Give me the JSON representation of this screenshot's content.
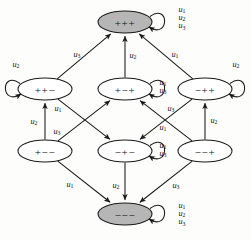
{
  "figure": {
    "node_shape": "ellipse",
    "colors": {
      "stroke": "#1a1a1a",
      "node_fill": "#ffffff",
      "node_fill_shaded": "#b6b6b6",
      "background": "#fdfdfc",
      "text": "#111111"
    }
  },
  "nodes": [
    {
      "id": "ppp",
      "label": "+++",
      "shaded": true,
      "cx": 125,
      "cy": 22,
      "rx": 27,
      "ry": 11
    },
    {
      "id": "ppm",
      "label": "++−",
      "shaded": false,
      "cx": 45,
      "cy": 89,
      "rx": 27,
      "ry": 11
    },
    {
      "id": "pmp",
      "label": "+−+",
      "shaded": false,
      "cx": 125,
      "cy": 89,
      "rx": 27,
      "ry": 11
    },
    {
      "id": "mpp",
      "label": "−++",
      "shaded": false,
      "cx": 205,
      "cy": 89,
      "rx": 27,
      "ry": 11
    },
    {
      "id": "pmm",
      "label": "+−−",
      "shaded": false,
      "cx": 45,
      "cy": 151,
      "rx": 27,
      "ry": 11
    },
    {
      "id": "mpm",
      "label": "−+−",
      "shaded": false,
      "cx": 125,
      "cy": 151,
      "rx": 27,
      "ry": 11
    },
    {
      "id": "mmp",
      "label": "−−+",
      "shaded": false,
      "cx": 205,
      "cy": 151,
      "rx": 27,
      "ry": 11
    },
    {
      "id": "mmm",
      "label": "−−−",
      "shaded": true,
      "cx": 125,
      "cy": 214,
      "rx": 27,
      "ry": 11
    }
  ],
  "self_loops": [
    {
      "id": "loop-ppp",
      "node": "ppp",
      "side": "right",
      "labels": [
        "u1",
        "u2",
        "u3"
      ],
      "label_x": 182,
      "label_y": 9
    },
    {
      "id": "loop-ppm",
      "node": "ppm",
      "side": "left",
      "labels": [
        "u2"
      ],
      "label_x": 16,
      "label_y": 64
    },
    {
      "id": "loop-pmp",
      "node": "pmp",
      "side": "right",
      "labels": [
        "u1",
        "u3"
      ],
      "label_x": 163,
      "label_y": 82
    },
    {
      "id": "loop-mpp",
      "node": "mpp",
      "side": "right",
      "labels": [
        "u2"
      ],
      "label_x": 236,
      "label_y": 64
    },
    {
      "id": "loop-mpm",
      "node": "mpm",
      "side": "right",
      "labels": [
        "u1",
        "u3"
      ],
      "label_x": 163,
      "label_y": 145
    },
    {
      "id": "loop-mmm",
      "node": "mmm",
      "side": "right",
      "labels": [
        "u1",
        "u2",
        "u3"
      ],
      "label_x": 182,
      "label_y": 205
    }
  ],
  "edges": [
    {
      "id": "e-ppm-ppp",
      "from": "ppm",
      "to": "ppp",
      "label": "u3",
      "label_x": 77,
      "label_y": 54
    },
    {
      "id": "e-pmp-ppp",
      "from": "pmp",
      "to": "ppp",
      "label": "u2",
      "label_x": 133,
      "label_y": 55
    },
    {
      "id": "e-mpp-ppp",
      "from": "mpp",
      "to": "ppp",
      "label": "u1",
      "label_x": 175,
      "label_y": 54
    },
    {
      "id": "e-pmm-ppm",
      "from": "pmm",
      "to": "ppm",
      "label": "u2",
      "label_x": 34,
      "label_y": 121
    },
    {
      "id": "e-pmm-pmp",
      "from": "pmm",
      "to": "pmp",
      "label": "u3",
      "label_x": 57,
      "label_y": 131
    },
    {
      "id": "e-ppm-mpm",
      "from": "ppm",
      "to": "mpm",
      "label": "u1",
      "label_x": 58,
      "label_y": 108
    },
    {
      "id": "e-mmp-pmp",
      "from": "mmp",
      "to": "pmp",
      "label": "u3",
      "label_x": 171,
      "label_y": 108
    },
    {
      "id": "e-mpp-mpm",
      "from": "mpp",
      "to": "mpm",
      "label": "u1",
      "label_x": 163,
      "label_y": 127
    },
    {
      "id": "e-mmp-mpp",
      "from": "mmp",
      "to": "mpp",
      "label": "u2",
      "label_x": 214,
      "label_y": 120
    },
    {
      "id": "e-pmm-mmm",
      "from": "pmm",
      "to": "mmm",
      "label": "u1",
      "label_x": 70,
      "label_y": 184
    },
    {
      "id": "e-mpm-mmm",
      "from": "mpm",
      "to": "mmm",
      "label": "u2",
      "label_x": 116,
      "label_y": 185
    },
    {
      "id": "e-mmp-mmm",
      "from": "mmp",
      "to": "mmm",
      "label": "u3",
      "label_x": 176,
      "label_y": 185
    }
  ],
  "label_glyphs": {
    "u1": {
      "base": "u",
      "sub": "1"
    },
    "u2": {
      "base": "u",
      "sub": "2"
    },
    "u3": {
      "base": "u",
      "sub": "3"
    }
  }
}
